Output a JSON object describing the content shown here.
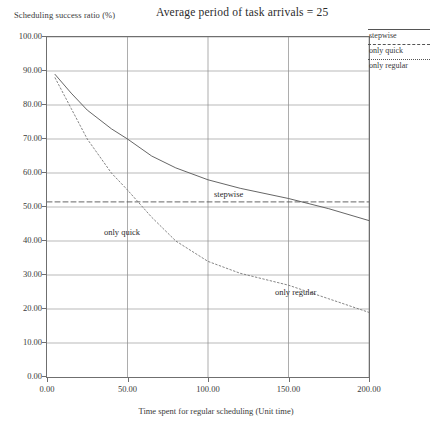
{
  "chart_data": {
    "type": "line",
    "title": "Average period of task arrivals = 25",
    "xlabel": "Time spent for regular scheduling (Unit time)",
    "ylabel": "Scheduling success ratio (%)",
    "xlim": [
      0,
      200
    ],
    "ylim": [
      0,
      100
    ],
    "xticks": [
      "0.00",
      "50.00",
      "100.00",
      "150.00",
      "200.00"
    ],
    "xtick_values": [
      0,
      50,
      100,
      150,
      200
    ],
    "yticks": [
      "0.00",
      "10.00",
      "20.00",
      "30.00",
      "40.00",
      "50.00",
      "60.00",
      "70.00",
      "80.00",
      "90.00",
      "100.00"
    ],
    "ytick_values": [
      0,
      10,
      20,
      30,
      40,
      50,
      60,
      70,
      80,
      90,
      100
    ],
    "grid": true,
    "legend_position": "top-right-outside",
    "series": [
      {
        "name": "stepwise",
        "style": "solid",
        "color": "#555555",
        "x": [
          5,
          15,
          25,
          40,
          50,
          65,
          80,
          100,
          120,
          150,
          175,
          200
        ],
        "y": [
          89.0,
          83.5,
          78.5,
          73.0,
          70.0,
          65.0,
          61.5,
          58.0,
          55.5,
          52.5,
          49.5,
          46.0
        ]
      },
      {
        "name": "only quick",
        "style": "dashed",
        "color": "#555555",
        "x": [
          0,
          200
        ],
        "y": [
          51.5,
          51.5
        ]
      },
      {
        "name": "only regular",
        "style": "dotted",
        "color": "#777777",
        "x": [
          5,
          15,
          25,
          40,
          50,
          65,
          80,
          100,
          120,
          150,
          175,
          200
        ],
        "y": [
          88.0,
          79.0,
          70.0,
          60.0,
          55.0,
          47.0,
          40.0,
          34.0,
          30.5,
          27.0,
          23.0,
          19.0
        ]
      }
    ],
    "annotations": [
      {
        "text": "stepwise",
        "x": 75,
        "y": 63
      },
      {
        "text": "only quick",
        "x": 8,
        "y": 54
      },
      {
        "text": "only regular",
        "x": 113,
        "y": 36
      }
    ]
  },
  "legend": {
    "items": [
      {
        "label": "stepwise",
        "style": "solid"
      },
      {
        "label": "only quick",
        "style": "dashed"
      },
      {
        "label": "only regular",
        "style": "dotted"
      }
    ]
  }
}
